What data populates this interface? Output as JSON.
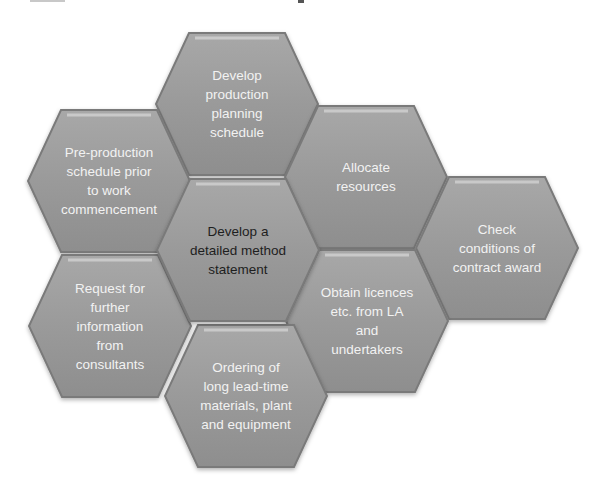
{
  "diagram": {
    "type": "hexagon-cluster",
    "center": {
      "id": "center",
      "label": "Develop a\ndetailed method\nstatement"
    },
    "nodes": [
      {
        "id": "top",
        "label": "Develop\nproduction\nplanning\nschedule"
      },
      {
        "id": "upper-left",
        "label": "Pre-production\nschedule prior\nto work\ncommencement"
      },
      {
        "id": "upper-right",
        "label": "Allocate\nresources"
      },
      {
        "id": "far-right",
        "label": "Check\nconditions of\ncontract award"
      },
      {
        "id": "lower-left",
        "label": "Request for\nfurther\ninformation\nfrom\nconsultants"
      },
      {
        "id": "lower-right",
        "label": "Obtain licences\netc. from LA\nand\nundertakers"
      },
      {
        "id": "bottom",
        "label": "Ordering of\nlong lead-time\nmaterials, plant\nand equipment"
      }
    ],
    "colors": {
      "hex_fill": "#9c9c9c",
      "hex_edge": "#7a7a7a",
      "hex_highlight": "#c9c9c9",
      "label_light": "#f2f2f2",
      "label_dark": "#1e1e1e"
    }
  }
}
